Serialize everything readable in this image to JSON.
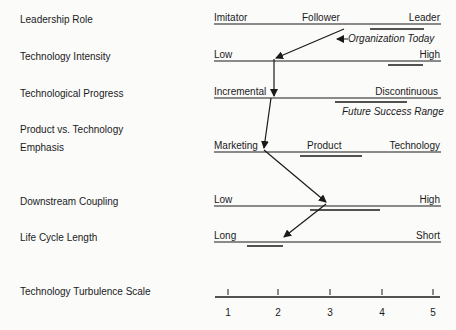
{
  "rows": [
    {
      "label": "Leadership Role",
      "left": "Imitator",
      "middle": "Follower",
      "right": "Leader"
    },
    {
      "label": "Technology Intensity",
      "left": "Low",
      "right": "High"
    },
    {
      "label": "Technological Progress",
      "left": "Incremental",
      "right": "Discontinuous"
    },
    {
      "label_line1": "Product vs. Technology",
      "label": "Emphasis",
      "left": "Marketing",
      "middle": "Product",
      "right": "Technology"
    },
    {
      "label": "Downstream Coupling",
      "left": "Low",
      "right": "High"
    },
    {
      "label": "Life Cycle Length",
      "left": "Long",
      "right": "Short"
    }
  ],
  "annotations": {
    "organization_today": "Organization Today",
    "future_success_range": "Future Success Range"
  },
  "scale": {
    "label": "Technology Turbulence Scale",
    "ticks": [
      "1",
      "2",
      "3",
      "4",
      "5"
    ]
  },
  "colors": {
    "line": "#1a1a1a",
    "background": "#fbfbfa"
  }
}
